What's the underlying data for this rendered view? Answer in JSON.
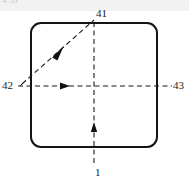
{
  "figure": {
    "top_band": {
      "partial_text": "4.5J"
    },
    "labels": [
      {
        "id": "41",
        "text": "41",
        "position": "top",
        "role": "diagonal-arrow-callout"
      },
      {
        "id": "42",
        "text": "42",
        "position": "left",
        "role": "horizontal-arrow-callout"
      },
      {
        "id": "43",
        "text": "43",
        "position": "right",
        "role": "horizontal-axis-callout"
      },
      {
        "id": "1",
        "text": "1",
        "position": "bottom",
        "role": "vertical-axis-callout"
      }
    ],
    "shape": {
      "name": "rounded-rectangle",
      "stroke_color": "#141414",
      "fill_color": "#ffffff",
      "stroke_width": 2,
      "corner_radius": 10,
      "x": 31,
      "y": 23,
      "width": 126,
      "height": 124
    },
    "lines": [
      {
        "name": "horizontal-dashed-axis",
        "style": "dashed",
        "color": "#1a1a1a",
        "x1": 18,
        "y1": 86,
        "x2": 172,
        "y2": 86,
        "arrow": "filled-triangle-right",
        "arrow_x": 66,
        "arrow_y": 86
      },
      {
        "name": "vertical-dashed-axis",
        "style": "dashed",
        "color": "#1a1a1a",
        "x1": 94,
        "y1": 22,
        "x2": 94,
        "y2": 166,
        "arrow": "filled-triangle-up",
        "arrow_x": 94,
        "arrow_y": 124
      },
      {
        "name": "diagonal-dashed-arrow",
        "style": "dashed",
        "color": "#1a1a1a",
        "x1": 22,
        "y1": 84,
        "x2": 94,
        "y2": 20,
        "arrow": "filled-triangle-upright",
        "arrow_x": 59,
        "arrow_y": 50
      }
    ]
  }
}
